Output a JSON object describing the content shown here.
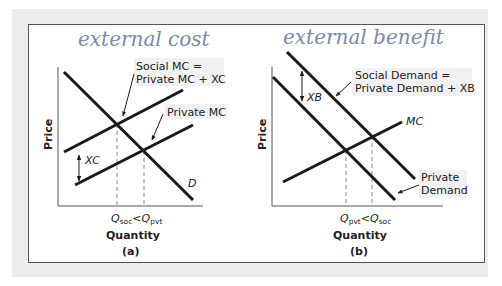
{
  "handwriting": {
    "left": "external cost",
    "right": "external benefit"
  },
  "panel_a": {
    "caption": "(a)",
    "y_axis": "Price",
    "x_axis": "Quantity",
    "q_left": "Q",
    "q_left_sub": "soc",
    "q_right": "Q",
    "q_right_sub": "pvt",
    "q_relation": "<",
    "social_mc_line1": "Social MC =",
    "social_mc_line2": "Private MC + XC",
    "private_mc": "Private MC",
    "demand": "D",
    "gap": "XC"
  },
  "panel_b": {
    "caption": "(b)",
    "y_axis": "Price",
    "x_axis": "Quantity",
    "q_left": "Q",
    "q_left_sub": "pvt",
    "q_right": "Q",
    "q_right_sub": "soc",
    "q_relation": "<",
    "social_demand_line1": "Social Demand =",
    "social_demand_line2": "Private Demand + XB",
    "mc": "MC",
    "private_demand_line1": "Private",
    "private_demand_line2": "Demand",
    "gap": "XB"
  },
  "colors": {
    "line": "#1a1a1a",
    "dashed": "#888888",
    "handwriting": "#7a8aa8",
    "page_bg": "#ececec"
  }
}
